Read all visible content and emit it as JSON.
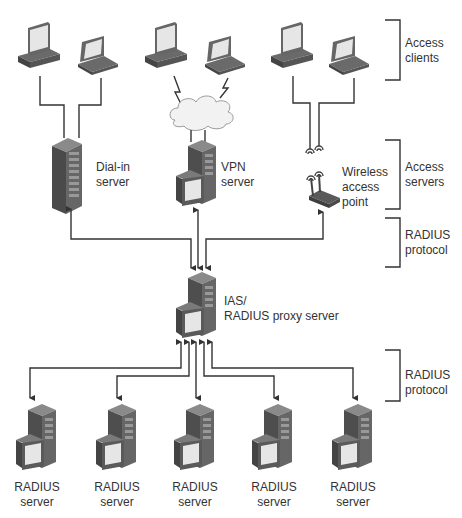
{
  "diagram": {
    "tiers": [
      {
        "id": "access-clients",
        "label_line1": "Access",
        "label_line2": "clients"
      },
      {
        "id": "access-servers",
        "label_line1": "Access",
        "label_line2": "servers"
      },
      {
        "id": "radius-protocol-top",
        "label_line1": "RADIUS",
        "label_line2": "protocol"
      },
      {
        "id": "radius-protocol-bottom",
        "label_line1": "RADIUS",
        "label_line2": "protocol"
      }
    ],
    "access_servers": [
      {
        "id": "dial-in",
        "line1": "Dial-in",
        "line2": "server",
        "connection": "wired"
      },
      {
        "id": "vpn",
        "line1": "VPN",
        "line2": "server",
        "connection": "internet-cloud"
      },
      {
        "id": "wireless",
        "line1": "Wireless",
        "line2": "access",
        "line3": "point",
        "connection": "wireless"
      }
    ],
    "proxy": {
      "line1": "IAS/",
      "line2": "RADIUS proxy server"
    },
    "radius_servers": [
      {
        "line1": "RADIUS",
        "line2": "server"
      },
      {
        "line1": "RADIUS",
        "line2": "server"
      },
      {
        "line1": "RADIUS",
        "line2": "server"
      },
      {
        "line1": "RADIUS",
        "line2": "server"
      },
      {
        "line1": "RADIUS",
        "line2": "server"
      }
    ],
    "colors": {
      "line": "#333333",
      "device_dark": "#5a5a5a",
      "device_mid": "#7a7a7a",
      "screen": "#e8e8e8",
      "cloud": "#f2f2f2"
    }
  }
}
